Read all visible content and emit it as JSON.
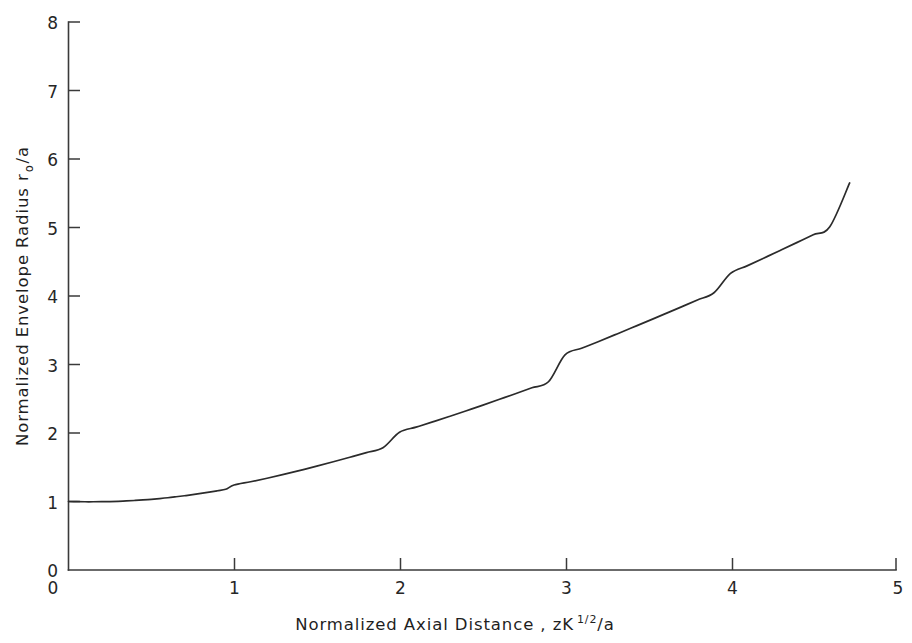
{
  "figure": {
    "background_color": "#ffffff",
    "line_color": "#2b2b2b",
    "axis_color": "#3a3a3a"
  },
  "axes": {
    "x_title_main": "Normalized  Axial  Distance ,  zK",
    "x_title_sup_num": "1",
    "x_title_sup_den": "2",
    "x_title_tail": "/a",
    "y_title_main": "Normalized  Envelope  Radius  r",
    "y_title_sub": "o",
    "y_title_tail": "/a"
  },
  "chart_data": {
    "type": "line",
    "title": "",
    "xlabel": "Normalized Axial Distance, zK^(1/2)/a",
    "ylabel": "Normalized Envelope Radius r_o/a",
    "xlim": [
      0,
      5
    ],
    "ylim": [
      0,
      8
    ],
    "xticks": [
      0,
      1,
      2,
      3,
      4,
      5
    ],
    "xtick_labels": [
      "0",
      "1",
      "2",
      "3",
      "4",
      "5"
    ],
    "yticks": [
      0,
      1,
      2,
      3,
      4,
      5,
      6,
      7,
      8
    ],
    "ytick_labels": [
      "0",
      "1",
      "2",
      "3",
      "4",
      "5",
      "6",
      "7",
      "8"
    ],
    "grid": false,
    "legend": null,
    "series": [
      {
        "name": "envelope radius",
        "x": [
          0.0,
          0.05,
          0.1,
          0.15,
          0.2,
          0.25,
          0.3,
          0.35,
          0.4,
          0.45,
          0.5,
          0.55,
          0.6,
          0.65,
          0.7,
          0.75,
          0.8,
          0.85,
          0.9,
          0.95,
          1.0,
          1.1,
          1.2,
          1.3,
          1.4,
          1.5,
          1.6,
          1.7,
          1.8,
          1.9,
          2.0,
          2.1,
          2.2,
          2.3,
          2.4,
          2.5,
          2.6,
          2.7,
          2.8,
          2.9,
          3.0,
          3.1,
          3.2,
          3.3,
          3.4,
          3.5,
          3.6,
          3.7,
          3.8,
          3.9,
          4.0,
          4.1,
          4.2,
          4.3,
          4.4,
          4.5,
          4.6,
          4.72
        ],
        "y": [
          1.0,
          0.998,
          0.996,
          0.996,
          0.997,
          0.999,
          1.003,
          1.008,
          1.015,
          1.023,
          1.032,
          1.043,
          1.055,
          1.069,
          1.084,
          1.1,
          1.118,
          1.137,
          1.157,
          1.178,
          1.24,
          1.288,
          1.34,
          1.396,
          1.455,
          1.516,
          1.58,
          1.646,
          1.714,
          1.784,
          2.01,
          2.085,
          2.162,
          2.241,
          2.322,
          2.404,
          2.488,
          2.573,
          2.66,
          2.748,
          3.14,
          3.236,
          3.333,
          3.432,
          3.532,
          3.633,
          3.735,
          3.838,
          3.942,
          4.047,
          4.33,
          4.44,
          4.552,
          4.665,
          4.779,
          4.894,
          5.01,
          5.65
        ]
      }
    ]
  }
}
